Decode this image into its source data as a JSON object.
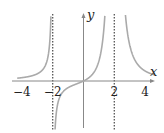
{
  "chart_data": {
    "type": "line",
    "title": "",
    "xlabel": "x",
    "ylabel": "y",
    "function_description": "rational function with vertical asymptotes at x = -2 (odd pole, +inf on left, -inf on right) and x = 2 (even pole, +inf both sides), passes through origin, horizontal asymptote y = 0",
    "function_form": "k*x/((x+2)*(x-2)^2)",
    "k": 4,
    "vertical_asymptotes": [
      -2,
      2
    ],
    "horizontal_asymptote": 0,
    "x_ticks": [
      -4,
      -2,
      2,
      4
    ],
    "x_tick_labels": [
      "−4",
      "−2",
      "2",
      "4"
    ],
    "xlim": [
      -4.3,
      4.6
    ],
    "ylim": [
      -3.3,
      4.3
    ],
    "grid": false,
    "curve_color": "#aaaaaa",
    "axis_color": "#888888",
    "asymptote_color": "#555555"
  }
}
